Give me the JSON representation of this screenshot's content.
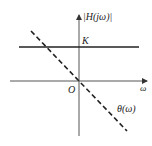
{
  "diagram": {
    "type": "frequency-response",
    "labels": {
      "y_axis": "|H(jω)|",
      "x_axis": "ω",
      "origin": "O",
      "magnitude_level": "K",
      "phase_curve": "θ(ω)"
    },
    "curves": [
      {
        "name": "magnitude",
        "style": "solid",
        "description": "constant |H(jω)| = K"
      },
      {
        "name": "phase",
        "style": "dashed",
        "description": "linear phase θ(ω) through origin, negative slope"
      }
    ],
    "colors": {
      "line": "#222222",
      "background": "#ffffff"
    }
  }
}
